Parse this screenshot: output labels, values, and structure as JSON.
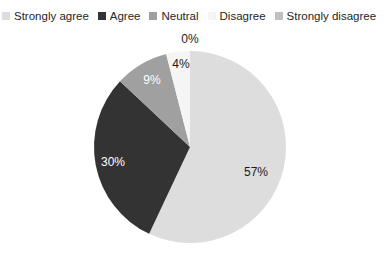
{
  "chart_data": {
    "type": "pie",
    "title": "",
    "legend_position": "top",
    "categories": [
      "Strongly agree",
      "Agree",
      "Neutral",
      "Disagree",
      "Strongly disagree"
    ],
    "values": [
      57,
      30,
      9,
      4,
      0
    ],
    "value_labels": [
      "57%",
      "30%",
      "9%",
      "4%",
      "0%"
    ],
    "colors": [
      "#dddddd",
      "#333333",
      "#a0a0a0",
      "#f5f5f5",
      "#bfbfbf"
    ],
    "units": "percent",
    "start_angle_deg": 0,
    "direction": "clockwise"
  },
  "legend": {
    "items": [
      {
        "label": "Strongly agree",
        "color": "#dddddd"
      },
      {
        "label": "Agree",
        "color": "#333333"
      },
      {
        "label": "Neutral",
        "color": "#a0a0a0"
      },
      {
        "label": "Disagree",
        "color": "#f5f5f5"
      },
      {
        "label": "Strongly disagree",
        "color": "#bfbfbf"
      }
    ]
  },
  "pie": {
    "center_x": 190,
    "center_y": 147,
    "radius": 96,
    "slices": [
      {
        "name": "Strongly agree",
        "label": "57%",
        "value": 57,
        "color": "#dddddd",
        "label_x": 256,
        "label_y": 172,
        "label_style": "dark"
      },
      {
        "name": "Agree",
        "label": "30%",
        "value": 30,
        "color": "#333333",
        "label_x": 113,
        "label_y": 162,
        "label_style": "light"
      },
      {
        "name": "Neutral",
        "label": "9%",
        "value": 9,
        "color": "#a0a0a0",
        "label_x": 152,
        "label_y": 80,
        "label_style": "light"
      },
      {
        "name": "Disagree",
        "label": "4%",
        "value": 4,
        "color": "#f5f5f5",
        "label_x": 181,
        "label_y": 64,
        "label_style": "dark"
      },
      {
        "name": "Strongly disagree",
        "label": "0%",
        "value": 0,
        "color": "#bfbfbf",
        "label_x": 190,
        "label_y": 39,
        "label_style": "dark"
      }
    ]
  }
}
